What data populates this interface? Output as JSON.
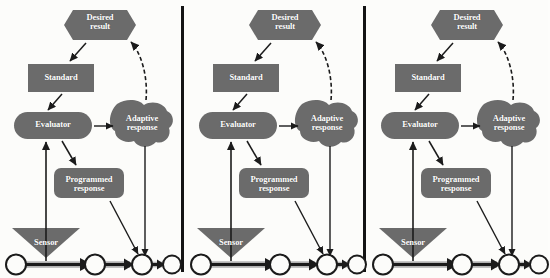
{
  "figure": {
    "type": "diagram",
    "panel_count": 3,
    "background_color": "#fcfcfa",
    "shape_fill": "#6b6b6b",
    "shape_fill_light": "#7a7a7a",
    "line_color": "#1b1b1b",
    "text_color": "#ffffff",
    "divider_color": "#141414"
  },
  "nodes": {
    "desired_result": {
      "label": "Desired\nresult",
      "shape": "hexagon"
    },
    "standard": {
      "label": "Standard",
      "shape": "rectangle"
    },
    "evaluator": {
      "label": "Evaluator",
      "shape": "pill"
    },
    "adaptive_response": {
      "label": "Adaptive\nresponse",
      "shape": "blob"
    },
    "programmed_response": {
      "label": "Programmed\nresponse",
      "shape": "rounded-rectangle"
    },
    "sensor": {
      "label": "Sensor",
      "shape": "triangle-down"
    }
  },
  "edges": [
    {
      "from": "desired_result",
      "to": "standard",
      "style": "solid-arrow"
    },
    {
      "from": "standard",
      "to": "evaluator",
      "style": "solid-arrow"
    },
    {
      "from": "evaluator",
      "to": "adaptive_response",
      "style": "solid-arrow"
    },
    {
      "from": "evaluator",
      "to": "programmed_response",
      "style": "solid-arrow"
    },
    {
      "from": "adaptive_response",
      "to": "desired_result",
      "style": "dashed-curved-arrow"
    },
    {
      "from": "adaptive_response",
      "to": "timeline_event_3",
      "style": "solid-arrow"
    },
    {
      "from": "programmed_response",
      "to": "timeline_event_3",
      "style": "solid-arrow"
    },
    {
      "from": "timeline",
      "to": "evaluator",
      "style": "solid-arrow-through-sensor"
    }
  ],
  "timeline": {
    "event_count": 4,
    "marker_shape": "circle-open",
    "connector_style": "gray-block-arrow",
    "segments": 3
  },
  "panels": [
    {
      "index": 1,
      "name": "panel-1"
    },
    {
      "index": 2,
      "name": "panel-2"
    },
    {
      "index": 3,
      "name": "panel-3"
    }
  ]
}
